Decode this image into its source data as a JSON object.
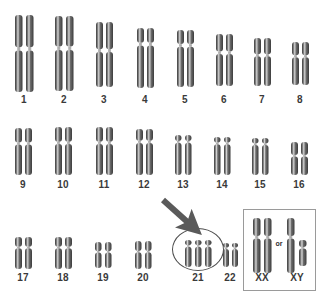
{
  "figure": {
    "background_color": "#ffffff",
    "chromosome_dark": "#3c3c3c",
    "chromosome_mid": "#6e6e6e",
    "chromosome_light": "#d8d8d8",
    "label_color": "#3a3a3a",
    "outline_color": "#4d4d4d",
    "box_color": "#9a9a9a",
    "arrow_color": "#5a5a5a"
  },
  "annotations": {
    "arrow": {
      "name": "trisomy-pointer-arrow",
      "color": "#5a5a5a",
      "from_x": 163,
      "from_y": 200,
      "to_x": 200,
      "to_y": 233
    },
    "circle": {
      "name": "trisomy-21-highlight-ellipse",
      "color": "#4d4d4d",
      "x": 172,
      "y": 228,
      "width": 52,
      "height": 43
    },
    "or_text": "or",
    "or_x": 279,
    "or_y": 243
  },
  "sex_box": {
    "x": 243,
    "y": 209,
    "width": 73,
    "height": 82
  },
  "rows": [
    {
      "name": "row-1",
      "label_y": 99,
      "pairs": [
        {
          "label": "1",
          "center_x": 24,
          "top": 15,
          "height": 77,
          "width": 7.5,
          "gap": 11,
          "count": 2,
          "centromere_frac": 0.44
        },
        {
          "label": "2",
          "center_x": 64,
          "top": 16,
          "height": 75,
          "width": 7.5,
          "gap": 11,
          "count": 2,
          "centromere_frac": 0.43
        },
        {
          "label": "3",
          "center_x": 104,
          "top": 22,
          "height": 65,
          "width": 7,
          "gap": 10,
          "count": 2,
          "centromere_frac": 0.44
        },
        {
          "label": "4",
          "center_x": 145,
          "top": 28,
          "height": 60,
          "width": 7,
          "gap": 10,
          "count": 2,
          "centromere_frac": 0.27
        },
        {
          "label": "5",
          "center_x": 185,
          "top": 30,
          "height": 57,
          "width": 7,
          "gap": 10,
          "count": 2,
          "centromere_frac": 0.27
        },
        {
          "label": "6",
          "center_x": 224,
          "top": 34,
          "height": 52,
          "width": 7,
          "gap": 10,
          "count": 2,
          "centromere_frac": 0.36
        },
        {
          "label": "7",
          "center_x": 262,
          "top": 38,
          "height": 48,
          "width": 7,
          "gap": 10,
          "count": 2,
          "centromere_frac": 0.36
        },
        {
          "label": "8",
          "center_x": 300,
          "top": 42,
          "height": 43,
          "width": 7,
          "gap": 10,
          "count": 2,
          "centromere_frac": 0.33
        }
      ]
    },
    {
      "name": "row-2",
      "label_y": 184,
      "pairs": [
        {
          "label": "9",
          "center_x": 23,
          "top": 128,
          "height": 47,
          "width": 7,
          "gap": 10,
          "count": 2,
          "centromere_frac": 0.33
        },
        {
          "label": "10",
          "center_x": 63,
          "top": 127,
          "height": 48,
          "width": 7,
          "gap": 10,
          "count": 2,
          "centromere_frac": 0.33
        },
        {
          "label": "11",
          "center_x": 104,
          "top": 127,
          "height": 48,
          "width": 7,
          "gap": 10,
          "count": 2,
          "centromere_frac": 0.33
        },
        {
          "label": "12",
          "center_x": 144,
          "top": 129,
          "height": 46,
          "width": 7,
          "gap": 10,
          "count": 2,
          "centromere_frac": 0.28
        },
        {
          "label": "13",
          "center_x": 183,
          "top": 135,
          "height": 40,
          "width": 6.5,
          "gap": 9.5,
          "count": 2,
          "centromere_frac": 0.17
        },
        {
          "label": "14",
          "center_x": 222,
          "top": 137,
          "height": 38,
          "width": 6.5,
          "gap": 9.5,
          "count": 2,
          "centromere_frac": 0.17
        },
        {
          "label": "15",
          "center_x": 260,
          "top": 138,
          "height": 37,
          "width": 6.5,
          "gap": 9.5,
          "count": 2,
          "centromere_frac": 0.17
        },
        {
          "label": "16",
          "center_x": 299,
          "top": 142,
          "height": 33,
          "width": 7,
          "gap": 10,
          "count": 2,
          "centromere_frac": 0.42
        }
      ]
    },
    {
      "name": "row-3",
      "label_y": 277,
      "pairs": [
        {
          "label": "17",
          "center_x": 23,
          "top": 237,
          "height": 32,
          "width": 7,
          "gap": 10,
          "count": 2,
          "centromere_frac": 0.33
        },
        {
          "label": "18",
          "center_x": 63,
          "top": 237,
          "height": 32,
          "width": 7,
          "gap": 10,
          "count": 2,
          "centromere_frac": 0.33
        },
        {
          "label": "19",
          "center_x": 103,
          "top": 242,
          "height": 26,
          "width": 6.5,
          "gap": 9.5,
          "count": 2,
          "centromere_frac": 0.38
        },
        {
          "label": "20",
          "center_x": 143,
          "top": 241,
          "height": 28,
          "width": 6.5,
          "gap": 9.5,
          "count": 2,
          "centromere_frac": 0.38
        },
        {
          "label": "21",
          "center_x": 198,
          "top": 240,
          "height": 27,
          "width": 6.5,
          "gap": 10,
          "count": 3,
          "centromere_frac": 0.22
        },
        {
          "label": "22",
          "center_x": 230,
          "top": 243,
          "height": 24,
          "width": 6,
          "gap": 9,
          "count": 2,
          "centromere_frac": 0.22
        }
      ]
    }
  ],
  "sex_chromosomes": [
    {
      "label": "XX",
      "center_x": 262,
      "top": 218,
      "height": 55,
      "width": 7.5,
      "gap": 11,
      "count": 2,
      "centromere_frac": 0.35,
      "label_y": 277
    },
    {
      "label": "XY",
      "center_x": 297,
      "top": 218,
      "height": 55,
      "width": 7.5,
      "gap": 12,
      "count": 2,
      "centromere_frac": 0.35,
      "label_y": 277,
      "second_short": true,
      "short_height": 26,
      "short_top_offset": 22
    }
  ]
}
